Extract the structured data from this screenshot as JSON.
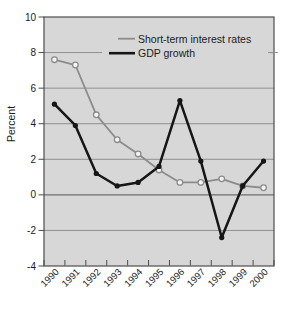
{
  "figure": {
    "ylabel": "Percent",
    "colors": {
      "page_bg": "#ffffff",
      "plot_bg": "#d7d7d7",
      "grid": "#8f8f8f",
      "zero_line": "#6e6e6e",
      "frame": "#4d4d4d",
      "text": "#1b1b1b",
      "marker_fill_open": "#f5f5f5"
    }
  },
  "chart_data": {
    "type": "line",
    "title": "",
    "xlabel": "",
    "ylabel": "Percent",
    "x": [
      "1990",
      "1991",
      "1992",
      "1993",
      "1994",
      "1995",
      "1996",
      "1997",
      "1998",
      "1999",
      "2000"
    ],
    "series": [
      {
        "name": "Short-term interest rates",
        "color": "#8c8c8c",
        "marker": "open-circle",
        "values": [
          7.6,
          7.3,
          4.5,
          3.1,
          2.3,
          1.4,
          0.7,
          0.7,
          0.9,
          0.5,
          0.4
        ]
      },
      {
        "name": "GDP growth",
        "color": "#161616",
        "marker": "filled-circle",
        "values": [
          5.1,
          3.9,
          1.2,
          0.5,
          0.7,
          1.6,
          5.3,
          1.9,
          -2.4,
          0.5,
          1.9
        ]
      }
    ],
    "ylim": [
      -4,
      10
    ],
    "yticks": [
      10,
      8,
      6,
      4,
      2,
      0,
      -2,
      -4
    ],
    "grid": true,
    "legend_position": "top-inside"
  }
}
